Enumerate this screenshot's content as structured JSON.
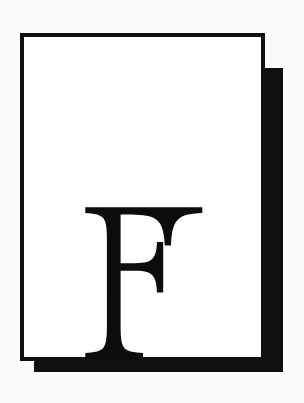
{
  "artwork": {
    "kind": "monogram-plate",
    "background_color": "#fbfbfa",
    "ink_color": "#100f0d",
    "paper_color": "#ffffff",
    "letter": "F",
    "letter_style": "serif-capital",
    "card": {
      "x": 20,
      "y": 33,
      "width": 245,
      "height": 328,
      "border_width": 4,
      "border_color": "#100f0d",
      "fill_color": "#ffffff"
    },
    "shadow_block": {
      "x": 34,
      "y": 68,
      "width": 249,
      "height": 304,
      "fill_color": "#100f0d",
      "offset_x": 14,
      "offset_y": 35
    },
    "glyph": {
      "character": "F",
      "x": 83,
      "y": 178,
      "width": 118,
      "height": 150,
      "color": "#0d0c0b"
    }
  }
}
